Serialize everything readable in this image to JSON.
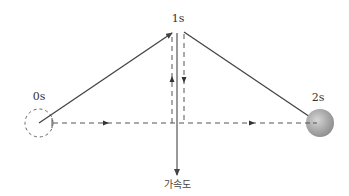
{
  "diagram": {
    "labels": {
      "t0": "0s",
      "t1": "1s",
      "t2": "2s",
      "acceleration": "가속도"
    },
    "colors": {
      "line": "#444444",
      "dashed": "#555555",
      "ball_fill": "#9a9a9a",
      "ball_highlight": "#d0d0d0",
      "background": "#ffffff"
    },
    "points": {
      "start_ball": {
        "x": 39,
        "y": 123,
        "r": 14,
        "style": "dashed-outline"
      },
      "apex": {
        "x": 178,
        "y": 32
      },
      "end_ball": {
        "x": 320,
        "y": 123,
        "r": 14,
        "style": "solid-gray"
      }
    },
    "arrows": [
      {
        "name": "velocity-0s-to-1s",
        "from": [
          39,
          123
        ],
        "to": [
          172,
          33
        ],
        "style": "solid"
      },
      {
        "name": "velocity-1s-to-2s",
        "from": [
          184,
          32
        ],
        "to": [
          317,
          121
        ],
        "style": "solid"
      },
      {
        "name": "acceleration",
        "from": [
          177,
          33
        ],
        "to": [
          177,
          175
        ],
        "style": "solid"
      },
      {
        "name": "horizontal-component",
        "from": [
          53,
          123
        ],
        "to": [
          306,
          123
        ],
        "style": "dashed"
      },
      {
        "name": "vertical-up-component",
        "from": [
          172,
          123
        ],
        "to": [
          172,
          33
        ],
        "style": "dashed"
      },
      {
        "name": "vertical-down-component",
        "from": [
          184,
          33
        ],
        "to": [
          184,
          123
        ],
        "style": "dashed"
      }
    ]
  }
}
